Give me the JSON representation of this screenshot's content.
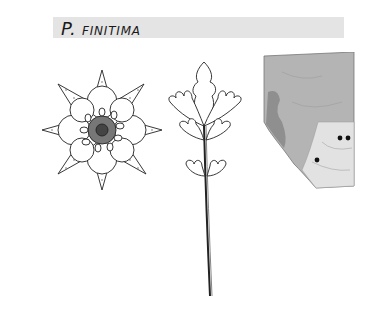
{
  "header": {
    "genus_abbrev": "P.",
    "species": "finitima"
  },
  "illustrations": {
    "flower": "flower-drawing",
    "leaf": "leaf-drawing",
    "map": "distribution-map"
  },
  "map": {
    "region": "Alberta",
    "points": [
      {
        "x": 78,
        "y": 86
      },
      {
        "x": 86,
        "y": 86
      },
      {
        "x": 55,
        "y": 108
      }
    ],
    "colors": {
      "dark": "#9a9a9a",
      "medium": "#b4b4b4",
      "light": "#e0e0e0",
      "dot": "#111111"
    }
  }
}
